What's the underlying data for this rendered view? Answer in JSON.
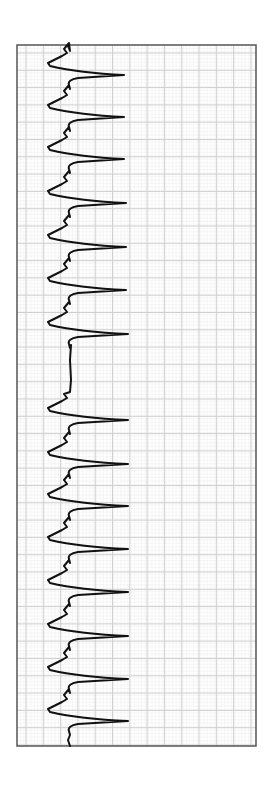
{
  "header": {
    "cropped_title": ""
  },
  "colors": {
    "background": "#ffffff",
    "grid_major": "#cfcfcf",
    "grid_minor": "#ececec",
    "frame": "#555555",
    "trace": "#111111"
  },
  "chart_data": {
    "type": "line",
    "title": "",
    "orientation": "vertical-strip",
    "frame": {
      "x0": 17,
      "y0": 45,
      "x1": 256,
      "y1": 746
    },
    "grid": {
      "on": true,
      "major_spacing_px": 17.3
    },
    "baseline_x": 70,
    "beats_peak_y": [
      75,
      117,
      159,
      203,
      247,
      290,
      334,
      420,
      464,
      506,
      549,
      592,
      636,
      679,
      721
    ],
    "peak_x": [
      124,
      124,
      124,
      126,
      126,
      126,
      128,
      128,
      128,
      128,
      128,
      128,
      128,
      128,
      128
    ],
    "pause": {
      "start_y": 340,
      "end_y": 398,
      "note": "prolonged pause between beats 7 and 8"
    },
    "series": [
      {
        "name": "ECG trace",
        "values": []
      }
    ],
    "xlabel": "",
    "ylabel": "",
    "legend": []
  }
}
